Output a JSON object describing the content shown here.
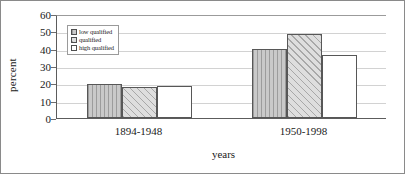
{
  "chart_data": {
    "type": "bar",
    "title": "",
    "subtitle": "",
    "xlabel": "years",
    "ylabel": "percent",
    "categories": [
      "1894-1948",
      "1950-1998"
    ],
    "series": [
      {
        "name": "low qualified",
        "values": [
          19.8,
          40.0
        ],
        "fill": "vertical-lines",
        "color": "#c9c9c9"
      },
      {
        "name": "qualified",
        "values": [
          17.7,
          48.5
        ],
        "fill": "diagonal-hatch",
        "color": "#dedede"
      },
      {
        "name": "high qualified",
        "values": [
          18.7,
          36.3
        ],
        "fill": "solid-white",
        "color": "#ffffff"
      }
    ],
    "ylim": [
      0,
      60
    ],
    "yticks": [
      0,
      10,
      20,
      30,
      40,
      50,
      60
    ],
    "ytick_labels": [
      "0",
      "10",
      "20",
      "30",
      "40",
      "50",
      "60"
    ],
    "grid": "horizontal",
    "legend_position": "top-left-inside",
    "bar_border_color": "#575757",
    "gridline_color": "#d2d2d2",
    "axis_color": "#5c5c5c"
  },
  "legend": {
    "items": [
      {
        "label": "low qualified"
      },
      {
        "label": "qualified"
      },
      {
        "label": "high qualified"
      }
    ]
  }
}
